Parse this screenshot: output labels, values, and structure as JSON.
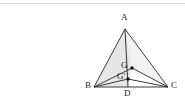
{
  "figure": {
    "kind": "geometry-diagram",
    "background_color": "#ffffff",
    "stroke_color": "#262626",
    "fill_color": "#e6e6e6",
    "fill_color_light": "#f2f2f2",
    "point_color": "#111111",
    "rule_color": "#dcdcdc",
    "stroke_width": 0.9,
    "point_radius": 1.7,
    "label_font_size": 9
  },
  "points": {
    "A": {
      "label": "A",
      "x": 125,
      "y": 29,
      "label_x": 121,
      "label_y": 13
    },
    "B": {
      "label": "B",
      "x": 94,
      "y": 87,
      "label_x": 85,
      "label_y": 81
    },
    "C": {
      "label": "C",
      "x": 168,
      "y": 87,
      "label_x": 171,
      "label_y": 81
    },
    "D": {
      "label": "D",
      "x": 128,
      "y": 87,
      "label_x": 124,
      "label_y": 89
    },
    "G": {
      "label": "G",
      "x": 132,
      "y": 68,
      "label_x": 121,
      "label_y": 61
    },
    "Gprime": {
      "label": "G'",
      "x": 128,
      "y": 79,
      "label_x": 117,
      "label_y": 72
    }
  },
  "segments": [
    {
      "name": "segment-AB",
      "from": "A",
      "to": "B"
    },
    {
      "name": "segment-AC",
      "from": "A",
      "to": "C"
    },
    {
      "name": "segment-BC",
      "from": "B",
      "to": "C"
    },
    {
      "name": "segment-AD",
      "from": "A",
      "to": "D"
    },
    {
      "name": "segment-BG",
      "from": "B",
      "to": "G"
    },
    {
      "name": "segment-GC",
      "from": "G",
      "to": "C"
    },
    {
      "name": "segment-BGprime",
      "from": "B",
      "to": "Gprime"
    },
    {
      "name": "segment-GprimeC",
      "from": "Gprime",
      "to": "C"
    }
  ],
  "regions": [
    {
      "name": "region-ABG",
      "vertices": "A,B,G",
      "shade": "dark"
    },
    {
      "name": "region-BGD",
      "vertices": "B,G,D",
      "shade": "dark"
    },
    {
      "name": "region-AGC",
      "vertices": "A,G,C",
      "shade": "light"
    }
  ],
  "marked_points": [
    "G",
    "Gprime"
  ]
}
